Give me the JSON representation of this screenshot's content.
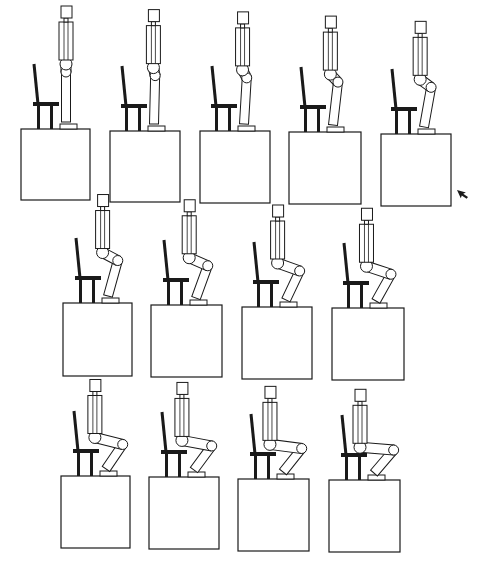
{
  "figure": {
    "rows": [
      {
        "frames": [
          {
            "id": 1,
            "box": [
              21,
              129,
              90,
              200
            ],
            "chair_x": 36,
            "knee": 0.0
          },
          {
            "id": 2,
            "box": [
              110,
              131,
              180,
              202
            ],
            "chair_x": 124,
            "knee": 0.05
          },
          {
            "id": 3,
            "box": [
              200,
              131,
              270,
              203
            ],
            "chair_x": 214,
            "knee": 0.12
          },
          {
            "id": 4,
            "box": [
              289,
              132,
              361,
              204
            ],
            "chair_x": 303,
            "knee": 0.22
          },
          {
            "id": 5,
            "box": [
              381,
              134,
              451,
              206
            ],
            "chair_x": 394,
            "knee": 0.32
          }
        ]
      },
      {
        "frames": [
          {
            "id": 6,
            "box": [
              63,
              303,
              132,
              376
            ],
            "chair_x": 78,
            "knee": 0.45
          },
          {
            "id": 7,
            "box": [
              151,
              305,
              222,
              377
            ],
            "chair_x": 166,
            "knee": 0.55
          },
          {
            "id": 8,
            "box": [
              242,
              307,
              312,
              379
            ],
            "chair_x": 256,
            "knee": 0.65
          },
          {
            "id": 9,
            "box": [
              332,
              308,
              404,
              380
            ],
            "chair_x": 346,
            "knee": 0.72
          }
        ]
      },
      {
        "frames": [
          {
            "id": 10,
            "box": [
              61,
              476,
              130,
              548
            ],
            "chair_x": 76,
            "knee": 0.82
          },
          {
            "id": 11,
            "box": [
              149,
              477,
              219,
              549
            ],
            "chair_x": 164,
            "knee": 0.88
          },
          {
            "id": 12,
            "box": [
              238,
              479,
              309,
              551
            ],
            "chair_x": 253,
            "knee": 0.94
          },
          {
            "id": 13,
            "box": [
              329,
              480,
              400,
              552
            ],
            "chair_x": 344,
            "knee": 1.0
          }
        ]
      }
    ],
    "cursor": {
      "x": 457,
      "y": 190,
      "icon": "mouse-pointer-arrow"
    },
    "colors": {
      "line": "#1a1a1a",
      "background": "#ffffff"
    }
  }
}
